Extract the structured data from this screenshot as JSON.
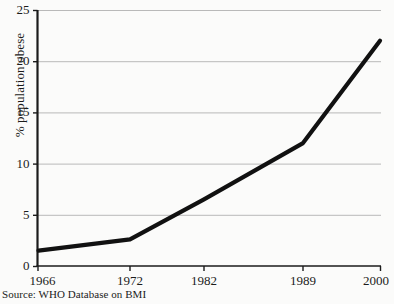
{
  "chart_data": {
    "type": "line",
    "title": "",
    "xlabel": "",
    "ylabel": "% population obese",
    "categories": [
      "1966",
      "1972",
      "1982",
      "1989",
      "2000"
    ],
    "x": [
      1966,
      1972,
      1982,
      1989,
      2000
    ],
    "values": [
      1.5,
      2.6,
      6.5,
      12,
      22
    ],
    "series": [
      {
        "name": "% population obese",
        "values": [
          1.5,
          2.6,
          6.5,
          12,
          22
        ]
      }
    ],
    "ylim": [
      0,
      25
    ],
    "yticks": [
      0,
      5,
      10,
      15,
      20,
      25
    ],
    "ytick_labels": [
      "0",
      "5",
      "10",
      "15",
      "20",
      "25"
    ],
    "xtick_labels": [
      "1966",
      "1972",
      "1982",
      "1989",
      "2000"
    ],
    "grid": "horizontal",
    "legend": "none",
    "line_color": "#111111",
    "grid_color": "#b9b9b9",
    "axis_color": "#1b1b1b",
    "background_color": "#fbfbfa"
  },
  "source": {
    "note": "Source: WHO Database on BMI"
  }
}
